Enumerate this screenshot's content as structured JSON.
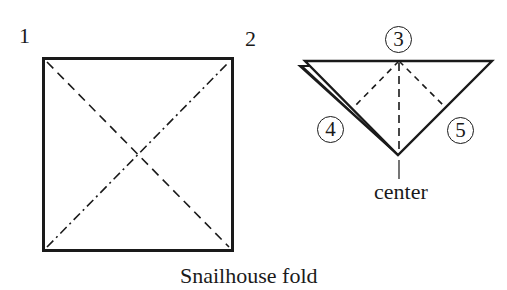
{
  "diagram": {
    "title": "Snailhouse fold",
    "square": {
      "corner_labels": [
        "1",
        "2"
      ],
      "bounds": {
        "x1": 43,
        "y1": 58,
        "x2": 233,
        "y2": 251
      },
      "diagonals": [
        {
          "from": "top-left",
          "to": "bottom-right",
          "style": "dashed"
        },
        {
          "from": "bottom-left",
          "to": "top-right",
          "style": "dash-dot"
        }
      ]
    },
    "triangle": {
      "step_markers": [
        "3",
        "4",
        "5"
      ],
      "apex_label": "center",
      "top_center": {
        "x": 399,
        "y": 61
      },
      "apex": {
        "x": 399,
        "y": 155
      },
      "right_corner": {
        "x": 492,
        "y": 61
      },
      "left_corner_top_layer": {
        "x": 305,
        "y": 60
      },
      "left_corner_bottom_layer": {
        "x": 300,
        "y": 66
      },
      "fold_lines": [
        {
          "from": "3",
          "to": "left-edge",
          "style": "dashed"
        },
        {
          "from": "3",
          "to": "right-edge",
          "style": "dashed"
        },
        {
          "from": "3",
          "to": "center",
          "style": "dashed"
        }
      ]
    },
    "colors": {
      "ink": "#1a1a1a",
      "background": "#ffffff"
    }
  }
}
